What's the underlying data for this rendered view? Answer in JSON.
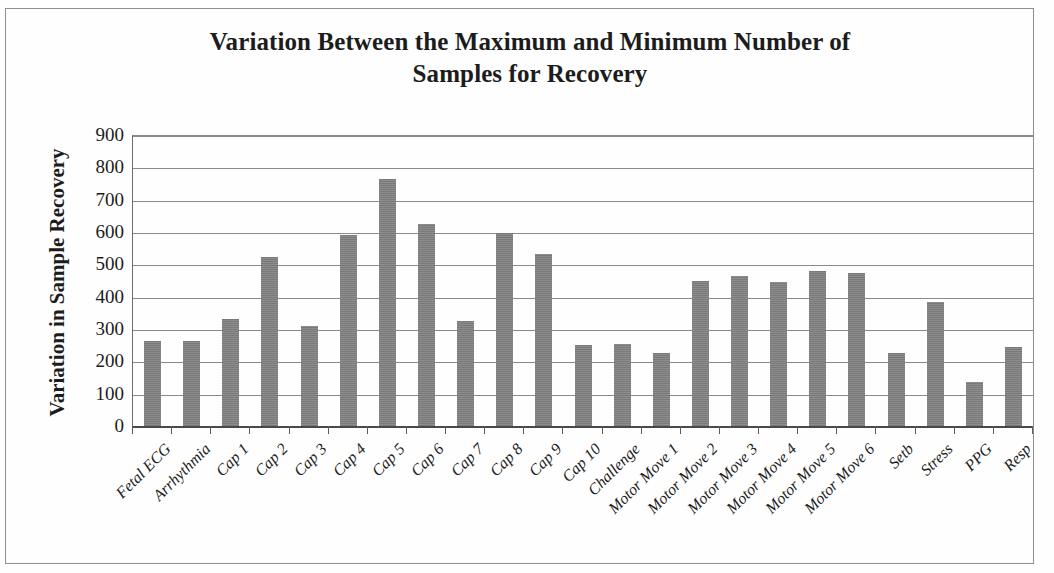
{
  "chart_data": {
    "type": "bar",
    "title": "Variation Between the Maximum and Minimum Number of Samples for Recovery",
    "title_line1": "Variation Between the Maximum and Minimum Number of",
    "title_line2": "Samples for Recovery",
    "xlabel": "",
    "ylabel": "Variation in Sample Recovery",
    "ylim": [
      0,
      900
    ],
    "ytick_step": 100,
    "yticks": [
      900,
      800,
      700,
      600,
      500,
      400,
      300,
      200,
      100,
      0
    ],
    "ytick_labels": [
      "900",
      "800",
      "700",
      "600",
      "500",
      "400",
      "300",
      "200",
      "100",
      "0"
    ],
    "grid": true,
    "legend": "none",
    "bar_color": "#808080",
    "categories": [
      "Fetal ECG",
      "Arrhythmia",
      "Cap 1",
      "Cap 2",
      "Cap 3",
      "Cap 4",
      "Cap 5",
      "Cap 6",
      "Cap 7",
      "Cap 8",
      "Cap 9",
      "Cap 10",
      "Challenge",
      "Motor Move 1",
      "Motor Move 2",
      "Motor Move 3",
      "Motor Move 4",
      "Motor Move 5",
      "Motor Move 6",
      "Setb",
      "Stress",
      "PPG",
      "Resp"
    ],
    "values": [
      265,
      265,
      333,
      527,
      311,
      594,
      766,
      628,
      327,
      601,
      535,
      253,
      257,
      230,
      453,
      468,
      449,
      481,
      476,
      230,
      387,
      138,
      247
    ]
  }
}
